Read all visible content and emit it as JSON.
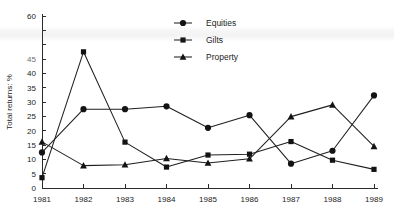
{
  "chart_data": {
    "type": "line",
    "title": "",
    "xlabel": "",
    "ylabel": "Total returns: %",
    "x": [
      "1981",
      "1982",
      "1983",
      "1984",
      "1985",
      "1986",
      "1987",
      "1988",
      "1989"
    ],
    "categories": [
      "1981",
      "1982",
      "1983",
      "1984",
      "1985",
      "1986",
      "1987",
      "1988",
      "1989"
    ],
    "xlim": [
      1981,
      1989
    ],
    "ylim": [
      0,
      60
    ],
    "yticks": [
      0,
      5,
      10,
      15,
      20,
      25,
      30,
      35,
      40,
      45,
      50,
      55,
      60
    ],
    "ytick_labels": [
      "0",
      "5",
      "10",
      "15",
      "20",
      "25",
      "30",
      "35",
      "40",
      "45",
      "50",
      "55",
      "60"
    ],
    "ytick_labels_shown": [
      "0",
      "5",
      "10",
      "15",
      "20",
      "25",
      "30",
      "35",
      "40",
      "45",
      "60"
    ],
    "grid": false,
    "legend_position": "top-center",
    "series": [
      {
        "name": "Equities",
        "marker": "circle",
        "values": [
          12.4,
          27.5,
          27.5,
          28.5,
          21.0,
          25.4,
          8.5,
          13.0,
          32.3
        ]
      },
      {
        "name": "Gilts",
        "marker": "square",
        "values": [
          3.6,
          47.5,
          16.0,
          7.3,
          11.5,
          11.8,
          16.2,
          9.7,
          6.5
        ]
      },
      {
        "name": "Property",
        "marker": "triangle",
        "values": [
          16.1,
          7.8,
          8.1,
          10.3,
          8.7,
          10.2,
          24.9,
          29.0,
          14.5
        ]
      }
    ]
  },
  "axis": {
    "y_title": "Total returns: %"
  },
  "legend": {
    "items": [
      {
        "label": "Equities",
        "marker": "circle"
      },
      {
        "label": "Gilts",
        "marker": "square"
      },
      {
        "label": "Property",
        "marker": "triangle"
      }
    ]
  },
  "colors": {
    "ink": "#1f1f1f",
    "marker": "#131313",
    "axis": "#2b2b2b",
    "background": "#ffffff"
  }
}
